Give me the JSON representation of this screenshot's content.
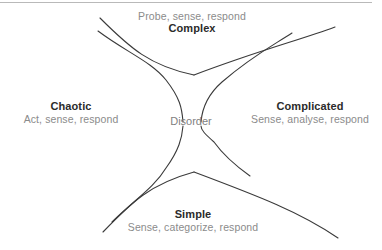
{
  "diagram": {
    "center_label": "Disorder",
    "line_color": "#3a3a3a",
    "name_color": "#2b2b2b",
    "action_color": "#8b8b8b",
    "background_color": "#ffffff",
    "rule_color": "#b9b9b9",
    "domains": [
      {
        "id": "complex",
        "name": "Complex",
        "action": "Probe, sense, respond",
        "position": "top"
      },
      {
        "id": "chaotic",
        "name": "Chaotic",
        "action": "Act, sense, respond",
        "position": "left"
      },
      {
        "id": "complicated",
        "name": "Complicated",
        "action": "Sense, analyse, respond",
        "position": "right"
      },
      {
        "id": "simple",
        "name": "Simple",
        "action": "Sense, categorize, respond",
        "position": "bottom"
      }
    ]
  }
}
